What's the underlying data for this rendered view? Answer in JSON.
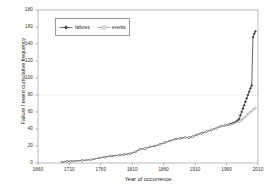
{
  "chart_data": {
    "type": "line",
    "title": "",
    "xlabel": "Year of occurrence",
    "ylabel": "Failure / event cumulative frequency",
    "xlim": [
      1660,
      2010
    ],
    "ylim": [
      0,
      180
    ],
    "xticks": [
      1660,
      1710,
      1760,
      1810,
      1860,
      1910,
      1960,
      2010
    ],
    "yticks": [
      0,
      20,
      40,
      60,
      80,
      100,
      120,
      140,
      160,
      180
    ],
    "grid": "single horizontal gridline at y=80",
    "legend_position": "upper-left inside axes",
    "series": [
      {
        "name": "failures",
        "marker": "filled-diamond",
        "color": "#333333",
        "points": [
          [
            1698,
            1
          ],
          [
            1706,
            2
          ],
          [
            1712,
            2
          ],
          [
            1730,
            3
          ],
          [
            1745,
            4
          ],
          [
            1758,
            6
          ],
          [
            1766,
            7
          ],
          [
            1775,
            8
          ],
          [
            1788,
            9
          ],
          [
            1797,
            10
          ],
          [
            1806,
            11
          ],
          [
            1815,
            13
          ],
          [
            1822,
            16
          ],
          [
            1830,
            17
          ],
          [
            1838,
            19
          ],
          [
            1846,
            20
          ],
          [
            1854,
            22
          ],
          [
            1862,
            24
          ],
          [
            1870,
            26
          ],
          [
            1878,
            28
          ],
          [
            1886,
            29
          ],
          [
            1894,
            30
          ],
          [
            1900,
            30
          ],
          [
            1906,
            31
          ],
          [
            1912,
            33
          ],
          [
            1920,
            35
          ],
          [
            1928,
            37
          ],
          [
            1936,
            39
          ],
          [
            1944,
            41
          ],
          [
            1950,
            43
          ],
          [
            1956,
            44
          ],
          [
            1962,
            45
          ],
          [
            1966,
            46
          ],
          [
            1970,
            47
          ],
          [
            1974,
            48
          ],
          [
            1977,
            50
          ],
          [
            1980,
            52
          ],
          [
            1982,
            56
          ],
          [
            1984,
            60
          ],
          [
            1986,
            64
          ],
          [
            1988,
            68
          ],
          [
            1990,
            72
          ],
          [
            1992,
            76
          ],
          [
            1994,
            80
          ],
          [
            1996,
            84
          ],
          [
            1998,
            88
          ],
          [
            2000,
            91
          ],
          [
            2002,
            148
          ],
          [
            2004,
            152
          ],
          [
            2006,
            155
          ]
        ]
      },
      {
        "name": "events",
        "marker": "open-diamond",
        "color": "#8a8a8a",
        "points": [
          [
            1698,
            1
          ],
          [
            1706,
            2
          ],
          [
            1712,
            2
          ],
          [
            1730,
            3
          ],
          [
            1745,
            4
          ],
          [
            1758,
            6
          ],
          [
            1766,
            7
          ],
          [
            1775,
            8
          ],
          [
            1788,
            9
          ],
          [
            1797,
            10
          ],
          [
            1806,
            11
          ],
          [
            1815,
            13
          ],
          [
            1822,
            16
          ],
          [
            1830,
            17
          ],
          [
            1838,
            19
          ],
          [
            1846,
            20
          ],
          [
            1854,
            22
          ],
          [
            1862,
            24
          ],
          [
            1870,
            26
          ],
          [
            1878,
            28
          ],
          [
            1886,
            29
          ],
          [
            1894,
            30
          ],
          [
            1900,
            30
          ],
          [
            1906,
            31
          ],
          [
            1912,
            33
          ],
          [
            1920,
            35
          ],
          [
            1928,
            37
          ],
          [
            1936,
            39
          ],
          [
            1944,
            41
          ],
          [
            1950,
            43
          ],
          [
            1956,
            44
          ],
          [
            1962,
            45
          ],
          [
            1966,
            45
          ],
          [
            1970,
            46
          ],
          [
            1974,
            47
          ],
          [
            1977,
            48
          ],
          [
            1980,
            49
          ],
          [
            1983,
            50
          ],
          [
            1986,
            52
          ],
          [
            1989,
            54
          ],
          [
            1992,
            56
          ],
          [
            1995,
            58
          ],
          [
            1998,
            60
          ],
          [
            2001,
            62
          ],
          [
            2004,
            64
          ],
          [
            2006,
            65
          ]
        ]
      }
    ]
  },
  "legend": {
    "entries": [
      {
        "label": "failures"
      },
      {
        "label": "events"
      }
    ]
  },
  "axes": {
    "x_title": "Year of occurrence",
    "y_title": "Failure / event cumulative frequency"
  }
}
